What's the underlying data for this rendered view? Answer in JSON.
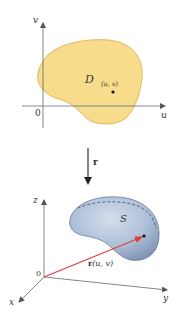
{
  "top_panel": {
    "axis_v_label": "v",
    "axis_u_label": "u",
    "origin_label": "0",
    "region_label": "D",
    "point_label": "(u, v)",
    "region_color": "#f7dc8c",
    "region_stroke": "#e3b85a"
  },
  "mapping": {
    "arrow_label": "r"
  },
  "bottom_panel": {
    "axis_z_label": "z",
    "axis_y_label": "y",
    "axis_x_label": "x",
    "origin_label": "0",
    "surface_label": "S",
    "vector_label_bold": "r",
    "vector_label_args": "(u, v)",
    "surface_color": "#aebfd8",
    "surface_stroke": "#5d6f8f",
    "vector_color": "#d9403a",
    "dashed_curve_color": "#4a5f86"
  }
}
